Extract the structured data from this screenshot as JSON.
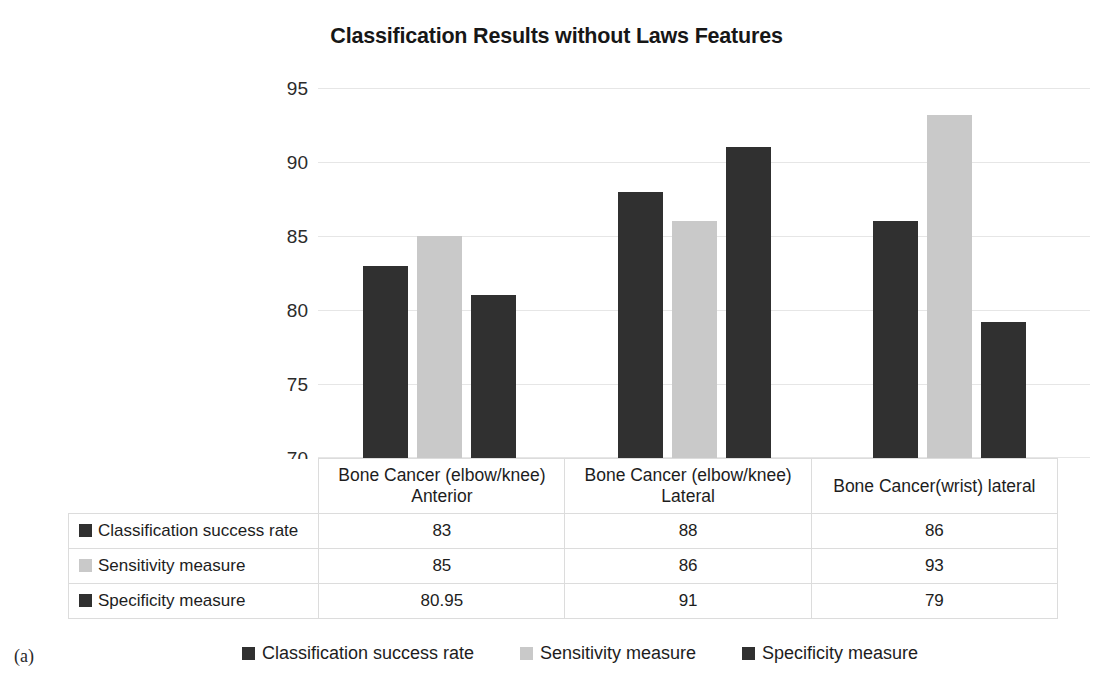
{
  "figure": {
    "caption_label": "(a)"
  },
  "chart_data": {
    "type": "bar",
    "title": "Classification Results without Laws Features",
    "xlabel": "",
    "ylabel": "",
    "ylim": [
      70,
      95
    ],
    "yticks": [
      70,
      75,
      80,
      85,
      90,
      95
    ],
    "grid": true,
    "legend_position": "bottom",
    "categories": [
      "Bone Cancer (elbow/knee) Anterior",
      "Bone Cancer (elbow/knee) Lateral",
      "Bone Cancer(wrist) lateral"
    ],
    "series": [
      {
        "name": "Classification success rate",
        "color": "#303030",
        "values": [
          83,
          88,
          86
        ],
        "labels": [
          "83",
          "88",
          "86"
        ]
      },
      {
        "name": "Sensitivity measure",
        "color": "#c9c9c9",
        "values": [
          85,
          86,
          93.2
        ],
        "labels": [
          "85",
          "86",
          "93"
        ]
      },
      {
        "name": "Specificity measure",
        "color": "#303030",
        "values": [
          81,
          91,
          79.2
        ],
        "labels": [
          "80.95",
          "91",
          "79"
        ]
      }
    ]
  },
  "axis": {
    "ticks": [
      "95",
      "90",
      "85",
      "80",
      "75",
      "70"
    ]
  },
  "table": {
    "header": {
      "corner": "",
      "columns": [
        "Bone Cancer (elbow/knee) Anterior",
        "Bone Cancer (elbow/knee) Lateral",
        "Bone Cancer(wrist) lateral"
      ],
      "columns_line1": [
        "Bone Cancer (elbow/knee)",
        "Bone Cancer (elbow/knee)",
        "Bone Cancer(wrist) lateral"
      ],
      "columns_line2": [
        "Anterior",
        "Lateral",
        ""
      ]
    },
    "rows": [
      {
        "label": "Classification success rate",
        "swatch": "dark",
        "values": [
          "83",
          "88",
          "86"
        ]
      },
      {
        "label": "Sensitivity measure",
        "swatch": "light",
        "values": [
          "85",
          "86",
          "93"
        ]
      },
      {
        "label": "Specificity measure",
        "swatch": "dark",
        "values": [
          "80.95",
          "91",
          "79"
        ]
      }
    ]
  },
  "legend": {
    "items": [
      {
        "label": "Classification success rate",
        "swatch": "dark"
      },
      {
        "label": "Sensitivity measure",
        "swatch": "light"
      },
      {
        "label": "Specificity measure",
        "swatch": "dark"
      }
    ]
  }
}
